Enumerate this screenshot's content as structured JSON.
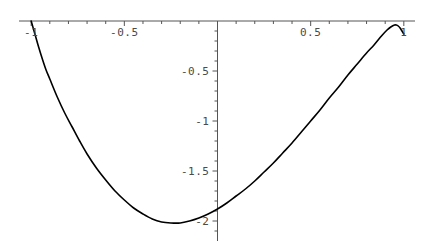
{
  "chart_data": {
    "type": "line",
    "title": "",
    "xlabel": "",
    "ylabel": "",
    "xlim": [
      -1.06,
      1.06
    ],
    "ylim": [
      -2.13,
      0.06
    ],
    "grid": false,
    "legend": null,
    "axis_style": "cross-hair axes through origin with minor ticks",
    "x_axis_position": 0,
    "y_axis_position": 0,
    "xticks": [
      {
        "value": -1,
        "label": "-1"
      },
      {
        "value": -0.5,
        "label": "-0.5"
      },
      {
        "value": 0.5,
        "label": "0.5"
      },
      {
        "value": 1,
        "label": "1"
      }
    ],
    "yticks": [
      {
        "value": -0.5,
        "label": "-0.5"
      },
      {
        "value": -1,
        "label": "-1"
      },
      {
        "value": -1.5,
        "label": "-1.5"
      },
      {
        "value": -2,
        "label": "-2"
      }
    ],
    "x_minor_tick_step": 0.1,
    "y_minor_tick_step": 0.1,
    "series": [
      {
        "name": "curve",
        "color": "#000000",
        "width": 1.6,
        "x": [
          -1.0,
          -0.98,
          -0.96,
          -0.94,
          -0.92,
          -0.9,
          -0.86,
          -0.82,
          -0.78,
          -0.74,
          -0.7,
          -0.65,
          -0.6,
          -0.55,
          -0.5,
          -0.45,
          -0.4,
          -0.35,
          -0.3,
          -0.25,
          -0.2,
          -0.15,
          -0.1,
          -0.05,
          0.0,
          0.05,
          0.1,
          0.15,
          0.2,
          0.25,
          0.3,
          0.35,
          0.4,
          0.45,
          0.5,
          0.55,
          0.6,
          0.65,
          0.7,
          0.75,
          0.8,
          0.84,
          0.88,
          0.91,
          0.93,
          0.95,
          0.96,
          0.97,
          0.98,
          0.99,
          1.0
        ],
        "y": [
          0.0,
          -0.13,
          -0.26,
          -0.38,
          -0.49,
          -0.58,
          -0.76,
          -0.92,
          -1.06,
          -1.2,
          -1.33,
          -1.47,
          -1.59,
          -1.7,
          -1.79,
          -1.87,
          -1.93,
          -1.98,
          -2.01,
          -2.02,
          -2.02,
          -2.0,
          -1.97,
          -1.93,
          -1.88,
          -1.82,
          -1.75,
          -1.68,
          -1.6,
          -1.51,
          -1.42,
          -1.32,
          -1.22,
          -1.11,
          -1.0,
          -0.89,
          -0.77,
          -0.66,
          -0.54,
          -0.43,
          -0.32,
          -0.24,
          -0.15,
          -0.09,
          -0.06,
          -0.04,
          -0.04,
          -0.05,
          -0.07,
          -0.1,
          -0.13
        ]
      }
    ],
    "annotations": {
      "minimum": {
        "x": -0.23,
        "y": -2.02
      },
      "left_endpoint": {
        "x": -1,
        "y": 0
      },
      "right_endpoint": {
        "x": 1,
        "y": -0.13
      }
    },
    "colors": {
      "curve": "#000000",
      "axis": "#555555",
      "tick_label": "#4a4a4a",
      "background": "#ffffff"
    }
  }
}
